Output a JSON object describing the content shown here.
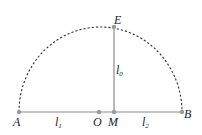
{
  "diagram": {
    "type": "semicircle-geometry",
    "colors": {
      "line": "#8a8a8a",
      "arc": "#333333",
      "point": "#9a9a9a",
      "text": "#222222"
    },
    "points": {
      "A": {
        "label": "A",
        "x": 19,
        "y": 112
      },
      "O": {
        "label": "O",
        "x": 99,
        "y": 112
      },
      "M": {
        "label": "M",
        "x": 114,
        "y": 112
      },
      "B": {
        "label": "B",
        "x": 182,
        "y": 112
      },
      "E": {
        "label": "E",
        "x": 114,
        "y": 27
      }
    },
    "segments": [
      {
        "from": "A",
        "to": "B",
        "style": "solid"
      },
      {
        "from": "M",
        "to": "E",
        "style": "solid"
      }
    ],
    "arc": {
      "center": "O",
      "from": "A",
      "to": "B",
      "style": "dashed"
    },
    "segment_labels": {
      "l1": {
        "base": "l",
        "sub": "1"
      },
      "l2": {
        "base": "l",
        "sub": "2"
      },
      "l0": {
        "base": "l",
        "sub": "0"
      }
    }
  }
}
